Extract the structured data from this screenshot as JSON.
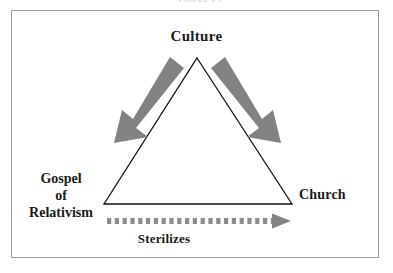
{
  "figure": {
    "caption_remnant": "FIGURE 4.1",
    "frame": {
      "border_color": "#9a9a9a"
    }
  },
  "labels": {
    "culture": "Culture",
    "gospel_line1": "Gospel",
    "gospel_line2": "of",
    "gospel_line3": "Relativism",
    "church": "Church",
    "sterilizes": "Sterilizes"
  },
  "colors": {
    "text": "#1a1a1a",
    "triangle_stroke": "#111111",
    "arrow_gray": "#828282",
    "dotted_gray": "#8c8c8c",
    "frame": "#9a9a9a",
    "background": "#ffffff"
  },
  "shapes": {
    "triangle": {
      "apex": [
        197,
        58
      ],
      "bottom_left": [
        104,
        204
      ],
      "bottom_right": [
        292,
        204
      ],
      "stroke_width": 1.3
    },
    "arrow_left": {
      "label": "culture-to-gospel-arrow",
      "from": [
        176,
        58
      ],
      "to": [
        119,
        131
      ],
      "direction": "down-left",
      "style": "solid thick block arrow"
    },
    "arrow_right": {
      "label": "culture-to-church-arrow",
      "from": [
        219,
        58
      ],
      "to": [
        276,
        131
      ],
      "direction": "down-right",
      "style": "solid thick block arrow"
    },
    "arrow_dotted": {
      "label": "gospel-sterilizes-church-arrow",
      "from": [
        106,
        221
      ],
      "to": [
        291,
        221
      ],
      "direction": "right",
      "style": "square dotted shaft with solid triangular head",
      "dot_count": 22
    }
  }
}
